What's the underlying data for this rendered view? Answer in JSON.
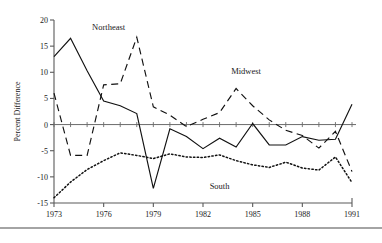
{
  "chart_data": {
    "type": "line",
    "title": "",
    "xlabel": "",
    "ylabel": "Percent Difference",
    "xlim": [
      1973,
      1991
    ],
    "ylim": [
      -15,
      20
    ],
    "yticks": [
      20,
      15,
      10,
      5,
      0,
      -5,
      -10,
      -15
    ],
    "ytick_labels": [
      "20",
      "15",
      "10",
      "5",
      "0",
      "-5",
      "-10",
      "-15"
    ],
    "xticks": [
      1973,
      1976,
      1979,
      1982,
      1985,
      1988,
      1991
    ],
    "xtick_labels": [
      "1973",
      "1976",
      "1979",
      "1982",
      "1985",
      "1988",
      "1991"
    ],
    "minor_xticks": [
      1974,
      1975,
      1977,
      1978,
      1980,
      1981,
      1983,
      1984,
      1986,
      1987,
      1989,
      1990
    ],
    "grid": false,
    "legend_position": "inline-annotations",
    "zero_line": true,
    "x": [
      1973,
      1974,
      1975,
      1976,
      1977,
      1978,
      1979,
      1980,
      1981,
      1982,
      1983,
      1984,
      1985,
      1986,
      1987,
      1988,
      1989,
      1990,
      1991
    ],
    "series": [
      {
        "name": "Northeast",
        "style": "solid",
        "color": "#111111",
        "label_x": 1976.3,
        "label_y": 18.0,
        "values": [
          13.0,
          16.5,
          10.3,
          4.5,
          3.6,
          2.1,
          -12.2,
          -0.8,
          -2.3,
          -4.6,
          -2.6,
          -4.3,
          0.2,
          -3.9,
          -3.9,
          -2.3,
          -3.0,
          -2.8,
          3.9
        ]
      },
      {
        "name": "Midwest",
        "style": "dashed",
        "color": "#111111",
        "label_x": 1984.6,
        "label_y": 9.6,
        "values": [
          6.0,
          -5.9,
          -5.9,
          7.6,
          7.8,
          16.7,
          3.4,
          1.8,
          -0.4,
          1.0,
          2.3,
          6.9,
          3.6,
          0.9,
          -1.1,
          -2.1,
          -4.5,
          -1.3,
          -9.0
        ]
      },
      {
        "name": "South",
        "style": "dotted",
        "color": "#111111",
        "label_x": 1983.0,
        "label_y": -12.4,
        "values": [
          -14.0,
          -11.0,
          -8.6,
          -6.9,
          -5.4,
          -5.9,
          -6.5,
          -5.6,
          -6.2,
          -6.3,
          -5.8,
          -6.9,
          -7.7,
          -8.2,
          -7.2,
          -8.3,
          -8.7,
          -6.2,
          -11.1
        ]
      }
    ]
  },
  "axis": {
    "y_title": "Percent Difference"
  }
}
